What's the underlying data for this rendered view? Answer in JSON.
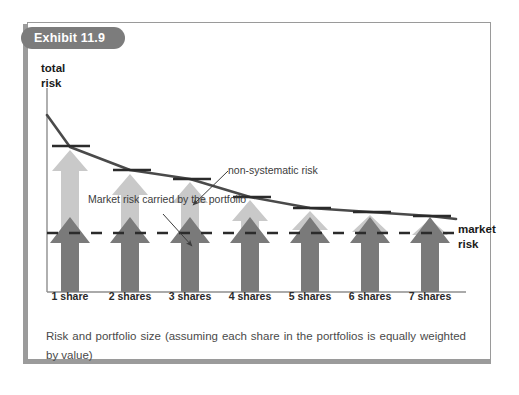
{
  "exhibit": {
    "badge_label": "Exhibit 11.9",
    "caption": "Risk and portfolio size (assuming each share in the portfolios is equally weighted by value)"
  },
  "labels": {
    "y_axis_line1": "total",
    "y_axis_line2": "risk",
    "market_risk_line1": "market",
    "market_risk_line2": "risk",
    "annotation_non_systematic": "non-systematic risk",
    "annotation_market_risk": "Market risk carried by the portfolio"
  },
  "colors": {
    "total_risk_curve": "#4a4a4a",
    "market_arrow": "#7a7a7a",
    "non_systematic_arrow": "#c9c9c9",
    "dashed_line": "#2b2b2b",
    "tick_mark": "#2b2b2b",
    "badge_background": "#7c7c7c",
    "badge_text": "#ffffff",
    "frame_border": "#9a9a9a",
    "axis_line": "#8e8e8e"
  },
  "chart_data": {
    "type": "bar",
    "title": "Exhibit 11.9",
    "subtitle": "Risk and portfolio size (assuming each share in the portfolios is equally weighted by value)",
    "xlabel": "",
    "ylabel": "total risk",
    "categories": [
      "1 share",
      "2 shares",
      "3 shares",
      "4 shares",
      "5 shares",
      "6 shares",
      "7 shares"
    ],
    "grid": false,
    "legend": "annotations",
    "annotations": [
      {
        "text": "non-systematic risk",
        "points_to": "light grey arrow (3 shares)"
      },
      {
        "text": "Market risk carried by the portfolio",
        "points_to": "dark grey arrow (3 shares)"
      },
      {
        "text": "market risk",
        "points_to": "dashed horizontal line"
      }
    ],
    "ylim": [
      0,
      100
    ],
    "market_risk_level": 42,
    "series": [
      {
        "name": "market risk (dark arrow)",
        "color": "#7a7a7a",
        "values": [
          42,
          42,
          42,
          42,
          42,
          42,
          42
        ]
      },
      {
        "name": "non-systematic risk (light arrow)",
        "color": "#c9c9c9",
        "values": [
          41,
          28,
          23,
          14,
          8,
          6,
          4
        ]
      },
      {
        "name": "total risk (curve / tick marks)",
        "color": "#4a4a4a",
        "values": [
          83,
          70,
          65,
          56,
          50,
          48,
          46
        ]
      }
    ],
    "curve_points": [
      {
        "x": 0.0,
        "y": 90
      },
      {
        "x": 1.0,
        "y": 83
      },
      {
        "x": 2.0,
        "y": 70
      },
      {
        "x": 3.0,
        "y": 65
      },
      {
        "x": 4.0,
        "y": 56
      },
      {
        "x": 5.0,
        "y": 50
      },
      {
        "x": 6.0,
        "y": 48
      },
      {
        "x": 7.0,
        "y": 46
      }
    ]
  }
}
